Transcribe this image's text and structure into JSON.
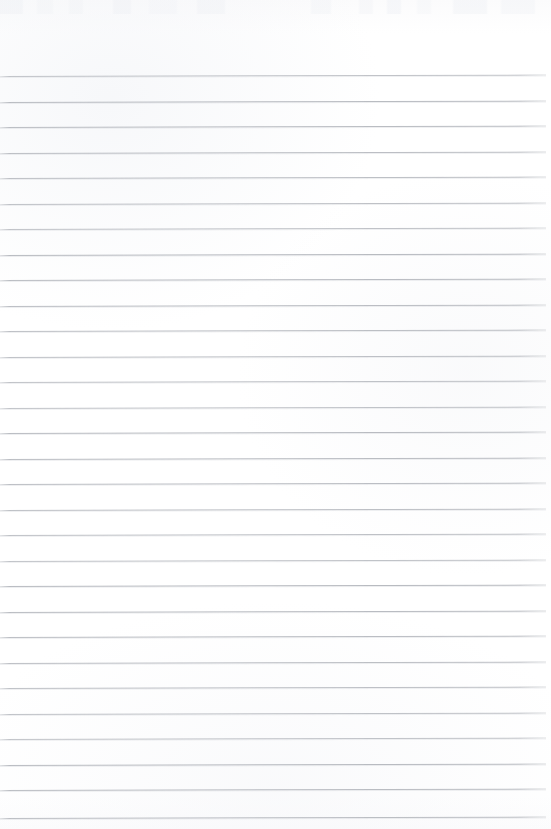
{
  "document": {
    "kind": "scanned-ruled-notebook-page",
    "title": "Blank Ruled Notebook Page",
    "content_text": "",
    "has_handwriting": false,
    "has_printed_text": false,
    "page_width_px": 551,
    "page_height_px": 829
  },
  "paper": {
    "background_color": "#fefefe",
    "tint_color": "#fbfbfc",
    "top_margin_px": 76,
    "bottom_margin_px": 11
  },
  "ruling": {
    "line_color": "#b4b7bd",
    "line_thickness_px": 1,
    "line_spacing_px": 25.5,
    "first_line_y_px": 76,
    "last_line_y_px": 818,
    "line_count": 30,
    "line_start_x_px": 0,
    "line_end_x_px": 546,
    "skew_degrees": -0.15,
    "line_y_positions": [
      76,
      101.5,
      127,
      152.5,
      178,
      203.5,
      229,
      254.5,
      280,
      305.5,
      331,
      356.5,
      382,
      407.5,
      433,
      458.5,
      484,
      509.5,
      535,
      560.5,
      586,
      611.5,
      637,
      662.5,
      688,
      713.5,
      739,
      764.5,
      790,
      818
    ]
  },
  "artifacts": {
    "top_edge_smudges": true,
    "top_edge_height_px": 14,
    "smudge_color": "#eff1f5"
  }
}
